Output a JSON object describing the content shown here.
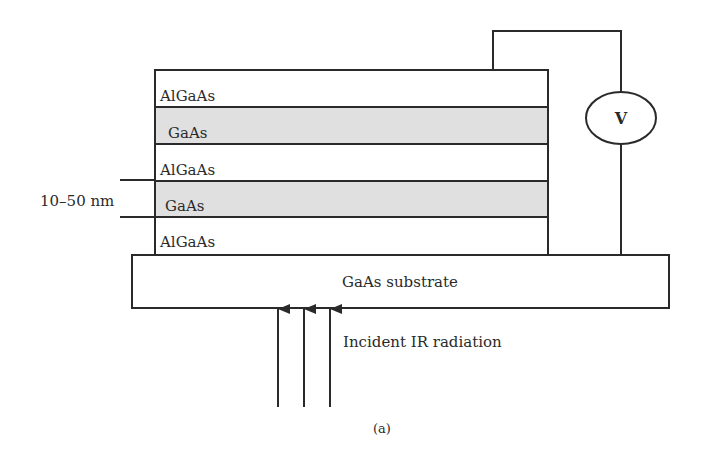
{
  "figure": {
    "caption": "(a)",
    "thickness_label": "10–50 nm",
    "layers": [
      {
        "name": "AlGaAs",
        "fill": "#ffffff"
      },
      {
        "name": "GaAs",
        "fill": "#e0e0e0"
      },
      {
        "name": "AlGaAs",
        "fill": "#ffffff"
      },
      {
        "name": "GaAs",
        "fill": "#e0e0e0"
      },
      {
        "name": "AlGaAs",
        "fill": "#ffffff"
      }
    ],
    "substrate_label": "GaAs substrate",
    "voltmeter_label": "V",
    "radiation_label": "Incident IR radiation"
  },
  "colors": {
    "line": "#2a2a2a",
    "shaded": "#e0e0e0"
  }
}
